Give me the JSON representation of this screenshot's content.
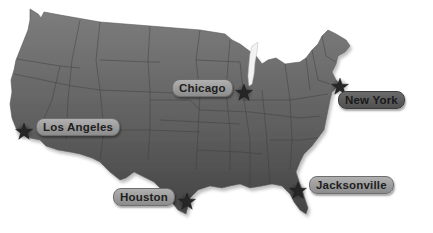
{
  "map": {
    "region": "Contiguous United States",
    "colors": {
      "land_top": "#7d7d7d",
      "land_bottom": "#474747",
      "borders": "#3a3a3a",
      "lake": "#f2f2f2",
      "star": "#2a2a2a",
      "label_light": "#9c9c9c",
      "label_dark": "#5c5c5c"
    },
    "cities": [
      {
        "name": "Chicago",
        "marker": "star-icon",
        "label_style": "light"
      },
      {
        "name": "New York",
        "marker": "star-icon",
        "label_style": "dark"
      },
      {
        "name": "Los Angeles",
        "marker": "star-icon",
        "label_style": "light"
      },
      {
        "name": "Houston",
        "marker": "star-icon",
        "label_style": "light"
      },
      {
        "name": "Jacksonville",
        "marker": "star-icon",
        "label_style": "light"
      }
    ]
  }
}
